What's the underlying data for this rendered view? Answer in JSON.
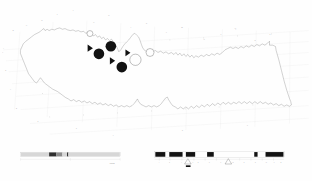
{
  "figure": {
    "type": "survey-map",
    "title": "",
    "background_color": "#ffffff",
    "ink_color": "#4a4a4a",
    "label_color": "#9a9a9a"
  },
  "grid": {
    "description": "Oblique survey grid overlaying an elongated coastal outline",
    "column_labels": [
      "A",
      "B",
      "C",
      "D",
      "E",
      "F",
      "G",
      "H",
      "J",
      "K",
      "L",
      "M",
      "N",
      "P",
      "Q",
      "R",
      "S"
    ],
    "row_labels": [
      "1",
      "2",
      "3",
      "4",
      "5",
      "6",
      "7"
    ],
    "column_positions": [
      {
        "label": "A",
        "x": 8,
        "y": 47
      },
      {
        "label": "B",
        "x": 38,
        "y": 32
      },
      {
        "label": "C",
        "x": 78,
        "y": 26
      },
      {
        "label": "D",
        "x": 124,
        "y": 21
      },
      {
        "label": "E",
        "x": 171,
        "y": 15
      },
      {
        "label": "F",
        "x": 219,
        "y": 11
      },
      {
        "label": "G",
        "x": 281,
        "y": 23
      },
      {
        "label": "H",
        "x": 326,
        "y": 16
      },
      {
        "label": "J",
        "x": 393,
        "y": 27
      },
      {
        "label": "K",
        "x": 440,
        "y": 24
      },
      {
        "label": "L",
        "x": 500,
        "y": 33
      },
      {
        "label": "M",
        "x": 546,
        "y": 27
      },
      {
        "label": "N",
        "x": 613,
        "y": 39
      },
      {
        "label": "P",
        "x": 664,
        "y": 34
      },
      {
        "label": "Q",
        "x": 707,
        "y": 29
      },
      {
        "label": "R",
        "x": 767,
        "y": 41
      },
      {
        "label": "S",
        "x": 812,
        "y": 34
      }
    ],
    "row_positions": [
      {
        "label": "1",
        "x": 7,
        "y": 52
      },
      {
        "label": "2",
        "x": 16,
        "y": 71
      },
      {
        "label": "3",
        "x": 30,
        "y": 90
      },
      {
        "label": "4",
        "x": 48,
        "y": 109
      },
      {
        "label": "5",
        "x": 113,
        "y": 121
      },
      {
        "label": "6",
        "x": 229,
        "y": 129
      },
      {
        "label": "7",
        "x": 340,
        "y": 136
      },
      {
        "label": "8",
        "x": 548,
        "y": 131
      },
      {
        "label": "9",
        "x": 744,
        "y": 127
      }
    ]
  },
  "sites": {
    "legend_note": "Site symbol cluster",
    "markers": [
      {
        "symbol": "filled-circle",
        "cx": 111,
        "cy": 52,
        "r": 5.4
      },
      {
        "symbol": "filled-circle",
        "cx": 99,
        "cy": 55,
        "r": 5.4
      },
      {
        "symbol": "filled-circle",
        "cx": 122,
        "cy": 67,
        "r": 5.4
      },
      {
        "symbol": "open-circle",
        "cx": 90,
        "cy": 33,
        "r": 3.6
      },
      {
        "symbol": "open-circle",
        "cx": 135,
        "cy": 60,
        "r": 6.0
      },
      {
        "symbol": "open-circle",
        "cx": 150,
        "cy": 52,
        "r": 4.4
      },
      {
        "symbol": "filled-triangle",
        "cx": 91,
        "cy": 47,
        "size": 5.2
      },
      {
        "symbol": "filled-triangle",
        "cx": 112,
        "cy": 61,
        "size": 5.0
      },
      {
        "symbol": "filled-triangle",
        "cx": 129,
        "cy": 52,
        "size": 4.6
      }
    ]
  },
  "scalebar": {
    "name": "distance-scale",
    "label": "1000 m",
    "segments": [
      "light",
      "dark",
      "mid",
      "light",
      "light",
      "light",
      "light"
    ]
  },
  "legend_bar": {
    "name": "stratigraphic-legend",
    "blocks": [
      {
        "type": "dark",
        "x": 0,
        "w": 9
      },
      {
        "type": "light",
        "x": 9,
        "w": 4
      },
      {
        "type": "dark",
        "x": 13,
        "w": 12
      },
      {
        "type": "light",
        "x": 25,
        "w": 4
      },
      {
        "type": "dark",
        "x": 29,
        "w": 9
      },
      {
        "type": "light",
        "x": 38,
        "w": 20
      },
      {
        "type": "dark",
        "x": 58,
        "w": 6
      },
      {
        "type": "light",
        "x": 64,
        "w": 37
      },
      {
        "type": "dark",
        "x": 101,
        "w": 3
      },
      {
        "type": "light",
        "x": 104,
        "w": 4
      },
      {
        "type": "dark",
        "x": 108,
        "w": 16
      }
    ],
    "tick_labels": [
      "1",
      "2",
      "3",
      "4",
      "5",
      "6",
      "7",
      "8",
      "9",
      "10",
      "11",
      "12"
    ],
    "triangle_markers": [
      {
        "x": 40,
        "label": "a"
      },
      {
        "x": 78,
        "label": "b"
      }
    ]
  }
}
